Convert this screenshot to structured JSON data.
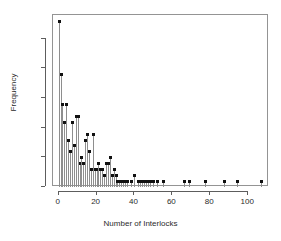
{
  "chart_data": {
    "type": "bar",
    "title": "",
    "subtitle": "",
    "xlabel": "Number of Interlocks",
    "ylabel": "Frequency",
    "xlim": [
      -3,
      111
    ],
    "ylim": [
      0,
      29
    ],
    "grid": false,
    "legend": null,
    "style": "stem-lollipop",
    "marker_color": "#111111",
    "stem_color": "#8e8e8e",
    "frame_color": "#949494",
    "xticks": [
      0,
      20,
      40,
      60,
      80,
      100
    ],
    "xtick_labels": [
      "0",
      "20",
      "40",
      "60",
      "80",
      "100"
    ],
    "yticks": [
      0,
      5,
      10,
      15,
      20,
      25
    ],
    "ytick_labels": [
      "0",
      "5",
      "10",
      "15",
      "20",
      "25"
    ],
    "x": [
      0,
      1,
      2,
      3,
      4,
      5,
      6,
      7,
      8,
      9,
      10,
      11,
      12,
      13,
      14,
      15,
      16,
      17,
      18,
      19,
      20,
      21,
      22,
      23,
      24,
      25,
      26,
      27,
      28,
      29,
      30,
      31,
      32,
      33,
      34,
      35,
      36,
      38,
      40,
      42,
      43,
      44,
      45,
      46,
      47,
      48,
      50,
      52,
      55,
      66,
      69,
      77,
      87,
      94,
      107
    ],
    "values": [
      28,
      19,
      14,
      11,
      14,
      8,
      6,
      11,
      7,
      12,
      12,
      4,
      5,
      4,
      8,
      9,
      6,
      3,
      9,
      3,
      3,
      4,
      3,
      3,
      2,
      4,
      4,
      5,
      2,
      3,
      2,
      1,
      1,
      1,
      1,
      1,
      1,
      1,
      2,
      1,
      1,
      1,
      1,
      1,
      1,
      1,
      1,
      1,
      1,
      1,
      1,
      1,
      1,
      1,
      1
    ]
  },
  "axes": {
    "x_title": "Number of Interlocks",
    "y_title": "Frequency"
  }
}
